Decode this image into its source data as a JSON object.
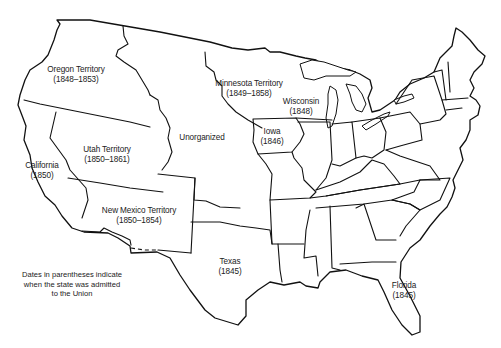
{
  "map": {
    "title": "",
    "regions": [
      {
        "id": "oregon",
        "name": "Oregon Territory",
        "dates": "(1848–1853)",
        "x": 76,
        "y": 70
      },
      {
        "id": "minnesota",
        "name": "Minnesota Territory",
        "dates": "(1849–1858)",
        "x": 249,
        "y": 83
      },
      {
        "id": "wisconsin",
        "name": "Wisconsin",
        "dates": "(1848)",
        "x": 301,
        "y": 101
      },
      {
        "id": "unorganized",
        "name": "Unorganized",
        "dates": "",
        "x": 202,
        "y": 137
      },
      {
        "id": "iowa",
        "name": "Iowa",
        "dates": "(1846)",
        "x": 272,
        "y": 131
      },
      {
        "id": "utah",
        "name": "Utah Territory",
        "dates": "(1850–1861)",
        "x": 107,
        "y": 149
      },
      {
        "id": "california",
        "name": "California",
        "dates": "(1850)",
        "x": 42,
        "y": 165
      },
      {
        "id": "new-mexico",
        "name": "New Mexico Territory",
        "dates": "(1850–1854)",
        "x": 139,
        "y": 208
      },
      {
        "id": "texas",
        "name": "Texas",
        "dates": "(1845)",
        "x": 230,
        "y": 259
      },
      {
        "id": "florida",
        "name": "Florida",
        "dates": "(1845)",
        "x": 404,
        "y": 284
      }
    ],
    "note": {
      "line1": "Dates in parentheses indicate",
      "line2": "when the state was admitted",
      "line3": "to the Union"
    },
    "colors": {
      "stroke": "#111111",
      "background": "#ffffff",
      "text": "#222222"
    }
  }
}
